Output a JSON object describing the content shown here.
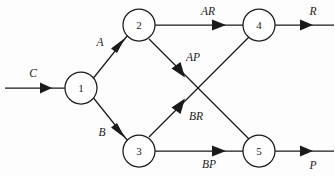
{
  "diagram": {
    "type": "directed-graph",
    "background_color": "#fdfdfd",
    "stroke_color": "#1a1a1a",
    "nodes": [
      {
        "id": "1",
        "label": "1",
        "cx": 81,
        "cy": 88,
        "r": 16
      },
      {
        "id": "2",
        "label": "2",
        "cx": 139,
        "cy": 25,
        "r": 16
      },
      {
        "id": "3",
        "label": "3",
        "cx": 139,
        "cy": 151,
        "r": 16
      },
      {
        "id": "4",
        "label": "4",
        "cx": 259,
        "cy": 25,
        "r": 16
      },
      {
        "id": "5",
        "label": "5",
        "cx": 259,
        "cy": 151,
        "r": 16
      }
    ],
    "edges": [
      {
        "id": "in-C",
        "label": "C",
        "from": "input",
        "to": "1",
        "label_x": 33,
        "label_y": 74
      },
      {
        "id": "e-1-2",
        "label": "A",
        "from": "1",
        "to": "2",
        "label_x": 100,
        "label_y": 43
      },
      {
        "id": "e-1-3",
        "label": "B",
        "from": "1",
        "to": "3",
        "label_x": 102,
        "label_y": 133
      },
      {
        "id": "e-2-4",
        "label": "AR",
        "from": "2",
        "to": "4",
        "label_x": 208,
        "label_y": 12
      },
      {
        "id": "e-2-5",
        "label": "AP",
        "from": "2",
        "to": "5",
        "label_x": 193,
        "label_y": 58
      },
      {
        "id": "e-3-4",
        "label": "BR",
        "from": "3",
        "to": "4",
        "label_x": 196,
        "label_y": 117
      },
      {
        "id": "e-3-5",
        "label": "BP",
        "from": "3",
        "to": "5",
        "label_x": 209,
        "label_y": 165
      },
      {
        "id": "out-R",
        "label": "R",
        "from": "4",
        "to": "output",
        "label_x": 313,
        "label_y": 12
      },
      {
        "id": "out-P",
        "label": "P",
        "from": "5",
        "to": "output",
        "label_x": 313,
        "label_y": 166
      }
    ]
  }
}
